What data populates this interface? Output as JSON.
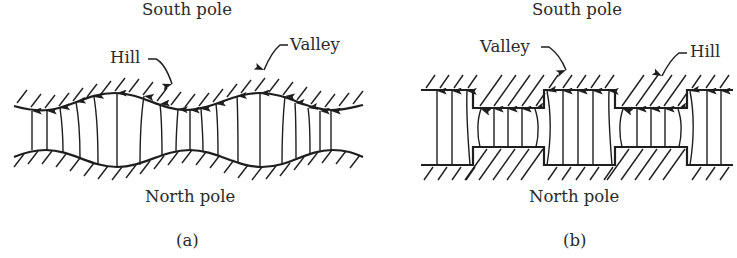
{
  "figure": {
    "panels": [
      {
        "id": "a",
        "caption": "(a)",
        "top_label": "South pole",
        "bottom_label": "North pole",
        "annotations": [
          {
            "text": "Hill",
            "points_to": "upper surface trough"
          },
          {
            "text": "Valley",
            "points_to": "upper surface crest"
          }
        ],
        "surface_shape": "sinusoidal",
        "field_direction": "upward (North to South)"
      },
      {
        "id": "b",
        "caption": "(b)",
        "top_label": "South pole",
        "bottom_label": "North pole",
        "annotations": [
          {
            "text": "Valley",
            "points_to": "upper surface raised step"
          },
          {
            "text": "Hill",
            "points_to": "upper surface lowered step"
          }
        ],
        "surface_shape": "rectangular steps",
        "field_direction": "upward (North to South)"
      }
    ],
    "colors": {
      "ink": "#1e1e1e",
      "text": "#2a2a2a",
      "background": "#ffffff"
    }
  }
}
